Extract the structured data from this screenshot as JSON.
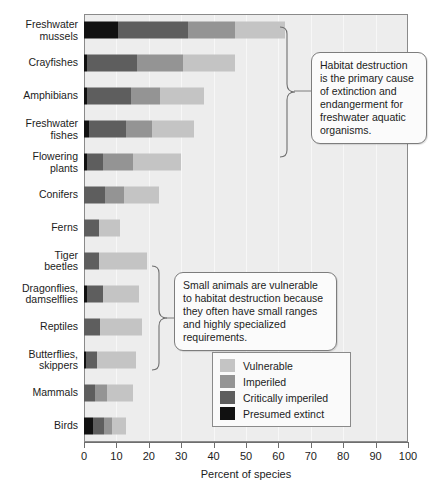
{
  "chart_data": {
    "type": "bar",
    "orientation": "horizontal",
    "stacked": true,
    "title": "",
    "xlabel": "Percent of species",
    "ylabel": "",
    "xlim": [
      0,
      100
    ],
    "xticks": [
      0,
      10,
      20,
      30,
      40,
      50,
      60,
      70,
      80,
      90,
      100
    ],
    "grid": "vertical",
    "legend_position": "inside-right-lower",
    "categories": [
      "Freshwater mussels",
      "Crayfishes",
      "Amphibians",
      "Freshwater fishes",
      "Flowering plants",
      "Conifers",
      "Ferns",
      "Tiger beetles",
      "Dragonflies, damselflies",
      "Reptiles",
      "Butterflies, skippers",
      "Mammals",
      "Birds"
    ],
    "series": [
      {
        "name": "Presumed extinct",
        "color": "#111111",
        "values": [
          10.5,
          1.0,
          1.0,
          1.5,
          0.8,
          0.0,
          0.0,
          0.0,
          0.8,
          0.0,
          0.5,
          0.0,
          2.8
        ]
      },
      {
        "name": "Critically imperiled",
        "color": "#5e5e5e",
        "values": [
          21.5,
          15.5,
          13.5,
          11.5,
          5.2,
          6.5,
          4.5,
          4.5,
          5.2,
          5.0,
          3.5,
          3.5,
          3.4
        ]
      },
      {
        "name": "Imperiled",
        "color": "#949494",
        "values": [
          14.5,
          14.0,
          9.0,
          8.0,
          9.0,
          6.0,
          0.0,
          0.0,
          0.0,
          0.0,
          0.0,
          3.5,
          2.4
        ]
      },
      {
        "name": "Vulnerable",
        "color": "#c4c4c4",
        "values": [
          15.5,
          16.0,
          13.5,
          13.0,
          15.0,
          10.5,
          6.5,
          15.0,
          11.0,
          13.0,
          12.0,
          8.0,
          4.4
        ]
      }
    ],
    "totals": [
      62.0,
      46.5,
      37.0,
      34.0,
      30.0,
      23.0,
      11.0,
      19.5,
      17.0,
      18.0,
      16.0,
      15.0,
      13.0
    ]
  },
  "axis": {
    "title": "Percent of species",
    "tick_labels": [
      "0",
      "10",
      "20",
      "30",
      "40",
      "50",
      "60",
      "70",
      "80",
      "90",
      "100"
    ]
  },
  "legend": {
    "items": [
      {
        "label": "Vulnerable",
        "color": "#c4c4c4"
      },
      {
        "label": "Imperiled",
        "color": "#949494"
      },
      {
        "label": "Critically imperiled",
        "color": "#5e5e5e"
      },
      {
        "label": "Presumed extinct",
        "color": "#111111"
      }
    ]
  },
  "callouts": [
    {
      "id": "top",
      "text": "Habitat destruction is the primary cause of extinction and endangerment for freshwater aquatic organisms.",
      "covers": [
        "Freshwater mussels",
        "Crayfishes",
        "Amphibians",
        "Freshwater fishes"
      ]
    },
    {
      "id": "bottom",
      "text": "Small animals are vulnerable to habitat destruction because they often have small ranges and highly specialized requirements.",
      "covers": [
        "Tiger beetles",
        "Dragonflies, damselflies",
        "Reptiles",
        "Butterflies, skippers"
      ]
    }
  ],
  "colors": {
    "plot_background": "#ededed",
    "frame": "#8a8a8a",
    "gridline": "#f7f7f7",
    "text": "#1c1c1c",
    "callout_background": "#fbfbfb"
  }
}
